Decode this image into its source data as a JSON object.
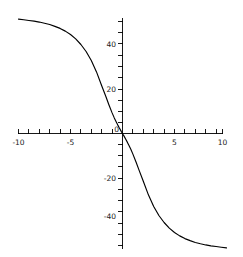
{
  "chart_data": {
    "type": "line",
    "title": "",
    "subtitle": "",
    "xlabel": "",
    "ylabel": "",
    "xlim": [
      -10,
      10
    ],
    "ylim": [
      -55,
      55
    ],
    "grid": false,
    "legend": null,
    "legend_position": "none",
    "line_color": "#000000",
    "background_color": "#ffffff",
    "axis_color": "#000000",
    "x_ticks_major": [
      -10,
      -5,
      5,
      10
    ],
    "x_tick_labels": [
      "-10",
      "-5",
      "5",
      "10"
    ],
    "x_ticks_minor": [
      -9,
      -8,
      -7,
      -6,
      -4,
      -3,
      -2,
      -1,
      1,
      2,
      3,
      4,
      6,
      7,
      8,
      9
    ],
    "y_ticks_major": [
      40,
      20,
      -20,
      -40
    ],
    "y_tick_labels": [
      "40",
      "20",
      "-20",
      "-40"
    ],
    "y_ticks_minor": [
      50,
      30,
      10,
      -10,
      -30,
      -50
    ],
    "origin_label": "0",
    "series": [
      {
        "name": "curve",
        "equation_form": "odd decreasing hyperbola, y approaches +50 as x goes to -10 and -50 as x goes to +10",
        "x": [
          -10,
          -9.5,
          -9,
          -8.5,
          -8,
          -7.5,
          -7,
          -6.5,
          -6,
          -5.5,
          -5,
          -4.5,
          -4,
          -3.5,
          -3,
          -2.5,
          -2,
          -1.6,
          -1.3,
          -1.0,
          -0.8,
          -0.6,
          -0.45,
          -0.3,
          -0.2,
          -0.12,
          -0.06,
          -0.02,
          0.02,
          0.06,
          0.12,
          0.2,
          0.3,
          0.45,
          0.6,
          0.8,
          1.0,
          1.3,
          1.6,
          2,
          2.5,
          3,
          3.5,
          4,
          4.5,
          5,
          5.5,
          6,
          6.5,
          7,
          7.5,
          8,
          8.5,
          9,
          9.5,
          10
        ],
        "y": [
          50.5,
          50.2,
          49.9,
          49.6,
          49.2,
          48.7,
          48.1,
          47.3,
          46.4,
          45.2,
          43.7,
          41.8,
          39.3,
          36.2,
          32.2,
          27.2,
          21.1,
          16.3,
          12.6,
          9.1,
          7.0,
          5.1,
          3.7,
          2.4,
          1.6,
          0.95,
          0.48,
          0.16,
          -0.16,
          -0.48,
          -0.95,
          -1.6,
          -2.4,
          -3.7,
          -5.1,
          -7.0,
          -9.1,
          -12.6,
          -16.3,
          -21.1,
          -27.2,
          -32.2,
          -36.2,
          -39.3,
          -41.8,
          -43.7,
          -45.2,
          -46.4,
          -47.3,
          -48.1,
          -48.7,
          -49.2,
          -49.6,
          -49.9,
          -50.2,
          -50.5
        ]
      }
    ]
  },
  "axes": {
    "x_axis_name": "horizontal-axis",
    "y_axis_name": "vertical-axis"
  }
}
